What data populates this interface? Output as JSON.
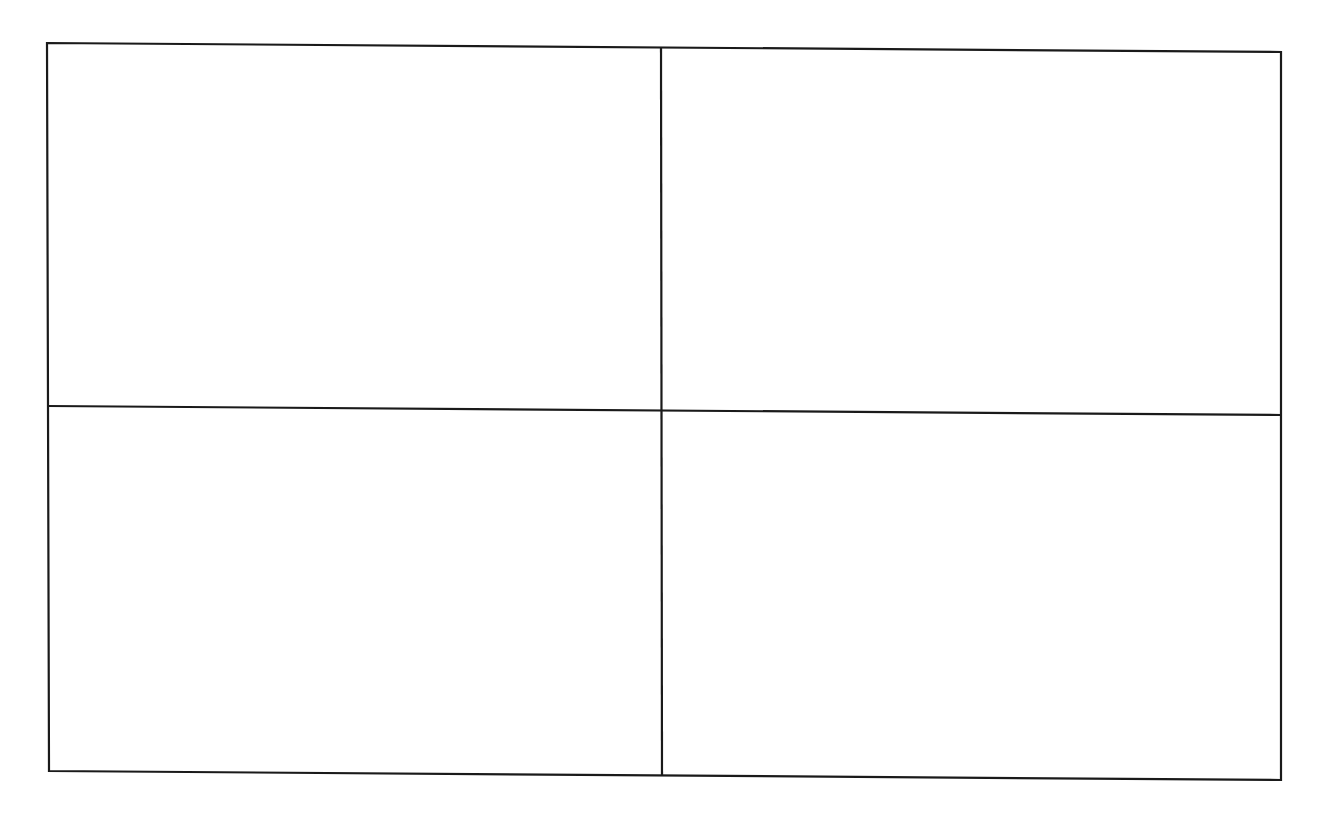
{
  "diagram": {
    "type": "grid",
    "rows": 2,
    "columns": 2,
    "line_color": "#1a1a1a",
    "background": "#ffffff",
    "cells": [
      {
        "row": 0,
        "col": 0,
        "text": ""
      },
      {
        "row": 0,
        "col": 1,
        "text": ""
      },
      {
        "row": 1,
        "col": 0,
        "text": ""
      },
      {
        "row": 1,
        "col": 1,
        "text": ""
      }
    ]
  }
}
